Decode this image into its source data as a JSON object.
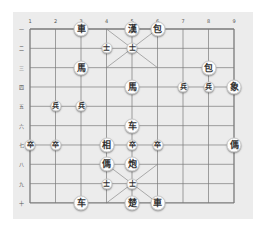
{
  "board": {
    "columns": 9,
    "rows": 10,
    "origin_x": 30,
    "origin_y": 29,
    "col_spacing": 25.5,
    "row_spacing": 19.33,
    "line_color": "#7a7a7a",
    "background_color": "#ececec",
    "column_labels": [
      "1",
      "2",
      "3",
      "4",
      "5",
      "6",
      "7",
      "8",
      "9"
    ],
    "row_labels": [
      "一",
      "二",
      "三",
      "四",
      "五",
      "六",
      "七",
      "八",
      "九",
      "十"
    ]
  },
  "pieces": [
    {
      "char": "車",
      "col": 3,
      "row": 1,
      "size": "large"
    },
    {
      "char": "漢",
      "col": 5,
      "row": 1,
      "size": "large"
    },
    {
      "char": "包",
      "col": 6,
      "row": 1,
      "size": "large"
    },
    {
      "char": "士",
      "col": 4,
      "row": 2,
      "size": "small"
    },
    {
      "char": "士",
      "col": 5,
      "row": 2,
      "size": "small"
    },
    {
      "char": "馬",
      "col": 3,
      "row": 3,
      "size": "large"
    },
    {
      "char": "包",
      "col": 8,
      "row": 3,
      "size": "large"
    },
    {
      "char": "馬",
      "col": 5,
      "row": 4,
      "size": "large"
    },
    {
      "char": "兵",
      "col": 7,
      "row": 4,
      "size": "small"
    },
    {
      "char": "兵",
      "col": 8,
      "row": 4,
      "size": "small"
    },
    {
      "char": "象",
      "col": 9,
      "row": 4,
      "size": "large"
    },
    {
      "char": "兵",
      "col": 2,
      "row": 5,
      "size": "small"
    },
    {
      "char": "兵",
      "col": 3,
      "row": 5,
      "size": "small"
    },
    {
      "char": "车",
      "col": 5,
      "row": 6,
      "size": "large"
    },
    {
      "char": "卒",
      "col": 1,
      "row": 7,
      "size": "small"
    },
    {
      "char": "卒",
      "col": 2,
      "row": 7,
      "size": "small"
    },
    {
      "char": "相",
      "col": 4,
      "row": 7,
      "size": "large"
    },
    {
      "char": "卒",
      "col": 5,
      "row": 7,
      "size": "small"
    },
    {
      "char": "卒",
      "col": 6,
      "row": 7,
      "size": "small"
    },
    {
      "char": "傌",
      "col": 9,
      "row": 7,
      "size": "large"
    },
    {
      "char": "傌",
      "col": 4,
      "row": 8,
      "size": "large"
    },
    {
      "char": "炮",
      "col": 5,
      "row": 8,
      "size": "large"
    },
    {
      "char": "士",
      "col": 4,
      "row": 9,
      "size": "small"
    },
    {
      "char": "士",
      "col": 5,
      "row": 9,
      "size": "small"
    },
    {
      "char": "车",
      "col": 3,
      "row": 10,
      "size": "large"
    },
    {
      "char": "楚",
      "col": 5,
      "row": 10,
      "size": "large"
    },
    {
      "char": "車",
      "col": 6,
      "row": 10,
      "size": "large"
    }
  ]
}
